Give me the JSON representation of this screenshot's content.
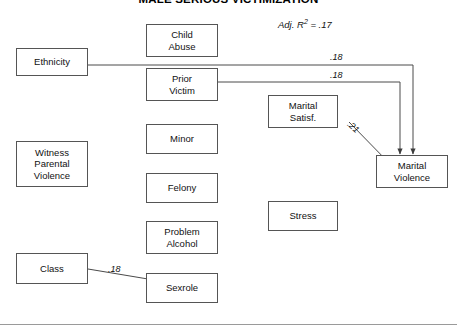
{
  "figure": {
    "title": "MALE SERIOUS VICTIMIZATION",
    "fit_statistic": "Adj. R",
    "fit_exponent": "2",
    "fit_value": " = .17"
  },
  "nodes": {
    "ethnicity": {
      "line1": "Ethnicity"
    },
    "witness": {
      "line1": "Witness",
      "line2": "Parental",
      "line3": "Violence"
    },
    "class": {
      "line1": "Class"
    },
    "child_abuse": {
      "line1": "Child",
      "line2": "Abuse"
    },
    "prior_victim": {
      "line1": "Prior",
      "line2": "Victim"
    },
    "minor": {
      "line1": "Minor"
    },
    "felony": {
      "line1": "Felony"
    },
    "problem_alcohol": {
      "line1": "Problem",
      "line2": "Alcohol"
    },
    "sexrole": {
      "line1": "Sexrole"
    },
    "marital_satisf": {
      "line1": "Marital",
      "line2": "Satisf."
    },
    "stress": {
      "line1": "Stress"
    },
    "marital_violence": {
      "line1": "Marital",
      "line2": "Violence"
    }
  },
  "paths": {
    "ethnicity_to_violence": ".18",
    "prior_victim_to_violence": ".18",
    "satisf_to_violence": ".21",
    "class_to_sexrole": ".18"
  },
  "colors": {
    "box_border": "#555555",
    "edge": "#4a4a4a",
    "text": "#111111",
    "rule": "#9a9a9a"
  }
}
